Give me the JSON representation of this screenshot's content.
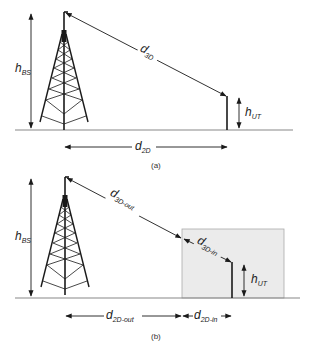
{
  "panels": [
    {
      "id": "a",
      "caption": "(a)",
      "labels": {
        "h_bs": {
          "main": "h",
          "sub": "BS"
        },
        "d_3d": {
          "main": "d",
          "sub": "3D"
        },
        "h_ut": {
          "main": "h",
          "sub": "UT"
        },
        "d_2d": {
          "main": "d",
          "sub": "2D"
        }
      }
    },
    {
      "id": "b",
      "caption": "(b)",
      "labels": {
        "h_bs": {
          "main": "h",
          "sub": "BS"
        },
        "d_3d_out": {
          "main": "d",
          "sub": "3D-out"
        },
        "d_3d_in": {
          "main": "d",
          "sub": "3D-in"
        },
        "h_ut": {
          "main": "h",
          "sub": "UT"
        },
        "d_2d_out": {
          "main": "d",
          "sub": "2D-out"
        },
        "d_2d_in": {
          "main": "d",
          "sub": "2D-in"
        }
      }
    }
  ],
  "colors": {
    "line": "#1a1a1a",
    "ground": "#888888",
    "building_fill": "#ebebeb",
    "building_stroke": "#aaaaaa"
  }
}
